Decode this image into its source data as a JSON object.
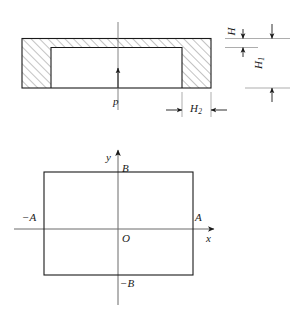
{
  "figure": {
    "colors": {
      "line": "#1a1a1a",
      "hatch": "#555555",
      "axis": "#4a4a4a",
      "background": "#ffffff"
    },
    "section_view": {
      "name": "cross-section",
      "pressure_label": "p",
      "dimensions": [
        {
          "key": "H",
          "label": "H",
          "subscript": "",
          "orientation": "vertical",
          "meaning": "top-wall thickness"
        },
        {
          "key": "H1",
          "label": "H",
          "subscript": "1",
          "orientation": "vertical",
          "meaning": "inner cavity height"
        },
        {
          "key": "H2",
          "label": "H",
          "subscript": "2",
          "orientation": "horizontal",
          "meaning": "side-wall thickness"
        }
      ]
    },
    "plan_view": {
      "name": "plan-view",
      "axis_x_label": "x",
      "axis_y_label": "y",
      "origin_label": "O",
      "edge_labels": {
        "right": "A",
        "left": "−A",
        "top": "B",
        "bottom": "−B"
      }
    }
  }
}
